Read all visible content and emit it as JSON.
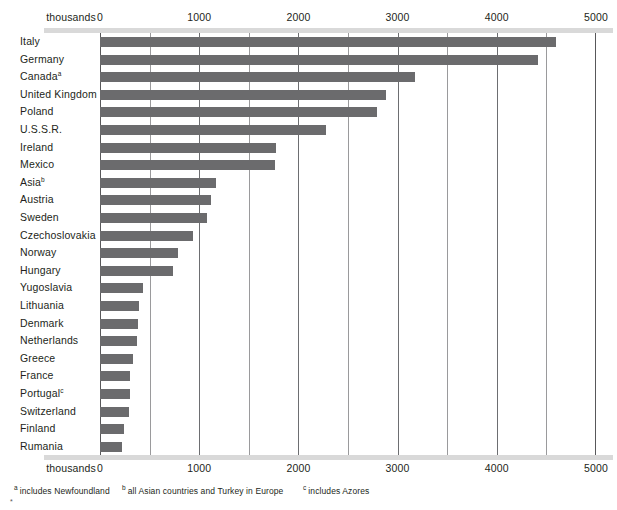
{
  "chart_data": {
    "type": "bar",
    "orientation": "horizontal",
    "title": "",
    "subtitle": "",
    "xlabel": "thousands",
    "ylabel": "",
    "xlim": [
      0,
      5000
    ],
    "xticks": [
      0,
      1000,
      2000,
      3000,
      4000,
      5000
    ],
    "xtick_labels": [
      "0",
      "1000",
      "2000",
      "3000",
      "4000",
      "5000"
    ],
    "minor_xticks": [
      500,
      1500,
      2500,
      3500,
      4500
    ],
    "grid": true,
    "legend": null,
    "unit_label": "thousands",
    "bar_color": "#6b6b6d",
    "categories": [
      "Italy",
      "Germany",
      "Canada",
      "United Kingdom",
      "Poland",
      "U.S.S.R.",
      "Ireland",
      "Mexico",
      "Asia",
      "Austria",
      "Sweden",
      "Czechoslovakia",
      "Norway",
      "Hungary",
      "Yugoslavia",
      "Lithuania",
      "Denmark",
      "Netherlands",
      "Greece",
      "France",
      "Portugal",
      "Switzerland",
      "Finland",
      "Rumania"
    ],
    "category_marks": [
      "",
      "",
      "a",
      "",
      "",
      "",
      "",
      "",
      "b",
      "",
      "",
      "",
      "",
      "",
      "",
      "",
      "",
      "",
      "",
      "",
      "c",
      "",
      "",
      ""
    ],
    "values": [
      4600,
      4420,
      3180,
      2880,
      2790,
      2280,
      1770,
      1760,
      1170,
      1120,
      1080,
      940,
      790,
      740,
      435,
      395,
      385,
      375,
      335,
      305,
      300,
      295,
      245,
      225
    ],
    "annotations": [
      {
        "mark": "a",
        "text": "includes Newfoundland"
      },
      {
        "mark": "b",
        "text": "all Asian countries and Turkey in Europe"
      },
      {
        "mark": "c",
        "text": "includes Azores"
      }
    ]
  }
}
